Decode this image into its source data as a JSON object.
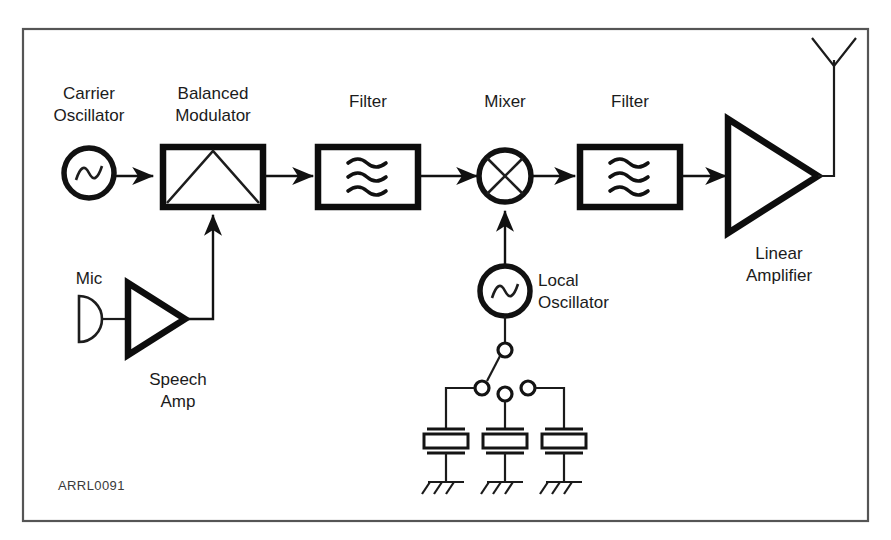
{
  "figure": {
    "caption_id": "ARRL0091",
    "frame_color": "#555555",
    "ink_color": "#111111",
    "background": "#ffffff"
  },
  "labels": {
    "carrier_oscillator": "Carrier\nOscillator",
    "carrier_oscillator_line1": "Carrier",
    "carrier_oscillator_line2": "Oscillator",
    "balanced_modulator_line1": "Balanced",
    "balanced_modulator_line2": "Modulator",
    "filter_1": "Filter",
    "mixer": "Mixer",
    "filter_2": "Filter",
    "linear_amplifier_line1": "Linear",
    "linear_amplifier_line2": "Amplifier",
    "mic": "Mic",
    "speech_amp_line1": "Speech",
    "speech_amp_line2": "Amp",
    "local_oscillator_line1": "Local",
    "local_oscillator_line2": "Oscillator"
  },
  "blocks": [
    {
      "id": "carrier-oscillator",
      "label": "Carrier Oscillator",
      "symbol": "circle-sine",
      "stage": 1
    },
    {
      "id": "balanced-modulator",
      "label": "Balanced Modulator",
      "symbol": "box-triangle",
      "stage": 2
    },
    {
      "id": "filter-1",
      "label": "Filter",
      "symbol": "box-waves",
      "stage": 3
    },
    {
      "id": "mixer",
      "label": "Mixer",
      "symbol": "circle-cross",
      "stage": 4
    },
    {
      "id": "filter-2",
      "label": "Filter",
      "symbol": "box-waves",
      "stage": 5
    },
    {
      "id": "linear-amplifier",
      "label": "Linear Amplifier",
      "symbol": "triangle-right",
      "stage": 6
    },
    {
      "id": "antenna",
      "label": "Antenna",
      "symbol": "whip-antenna",
      "stage": 7
    },
    {
      "id": "mic",
      "label": "Mic",
      "symbol": "microphone-d",
      "stage": 0
    },
    {
      "id": "speech-amp",
      "label": "Speech Amp",
      "symbol": "triangle-right",
      "stage": 1
    },
    {
      "id": "local-oscillator",
      "label": "Local Oscillator",
      "symbol": "circle-sine",
      "stage": 4
    }
  ],
  "switch": {
    "type": "rotary-selector",
    "poles": 1,
    "positions": 3,
    "selected_index": 0,
    "load": "crystal"
  },
  "crystals": [
    {
      "id": "crystal-1",
      "symbol": "quartz-crystal",
      "grounded": true
    },
    {
      "id": "crystal-2",
      "symbol": "quartz-crystal",
      "grounded": true
    },
    {
      "id": "crystal-3",
      "symbol": "quartz-crystal",
      "grounded": true
    }
  ],
  "signal_path": [
    "carrier-oscillator",
    "balanced-modulator",
    "filter-1",
    "mixer",
    "filter-2",
    "linear-amplifier",
    "antenna"
  ],
  "audio_path": [
    "mic",
    "speech-amp",
    "balanced-modulator"
  ],
  "injection_path": [
    "local-oscillator",
    "mixer"
  ]
}
